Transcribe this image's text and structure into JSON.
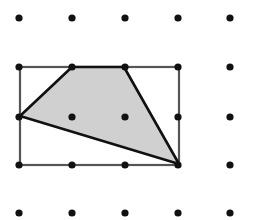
{
  "diagram": {
    "type": "dot-grid-geometry",
    "colors": {
      "background": "#ffffff",
      "dot": "#111111",
      "rectangle_stroke": "#555555",
      "polygon_stroke": "#111111",
      "polygon_fill": "#d0d0d0"
    },
    "grid": {
      "columns_x": [
        19,
        72,
        125,
        178,
        230
      ],
      "rows_y": [
        18,
        67,
        117,
        165,
        213
      ],
      "dot_radius": 3.6
    },
    "rectangle": {
      "x": 20,
      "y": 67,
      "width": 159,
      "height": 98
    },
    "polygon": {
      "shape": "quadrilateral",
      "shaded": true,
      "vertices": [
        [
          20,
          116
        ],
        [
          72,
          67
        ],
        [
          124,
          67
        ],
        [
          179,
          164
        ]
      ]
    }
  }
}
